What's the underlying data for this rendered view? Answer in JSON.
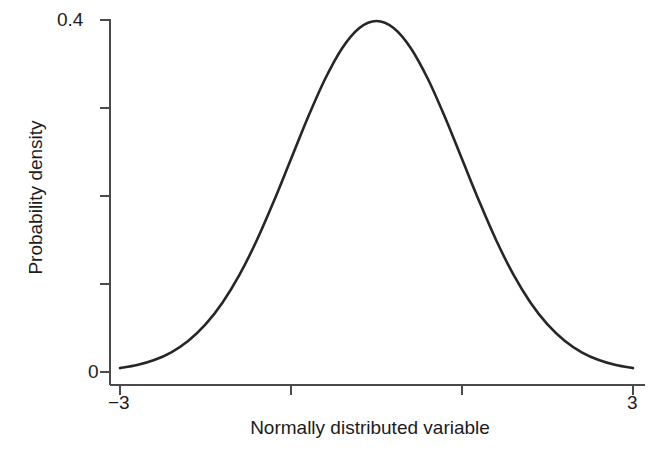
{
  "chart_data": {
    "type": "line",
    "title": "",
    "subtitle": "",
    "xlabel": "Normally distributed variable",
    "ylabel": "Probability density",
    "xlim": [
      -3,
      3
    ],
    "ylim": [
      0,
      0.4
    ],
    "grid": false,
    "legend": null,
    "legend_position": "none",
    "x_tick_labels": [
      "−3",
      "",
      "",
      "3"
    ],
    "x_tick_values": [
      -3,
      -1,
      1,
      3
    ],
    "y_tick_labels": [
      "0",
      "",
      "",
      "",
      "0.4"
    ],
    "y_tick_values": [
      0,
      0.1,
      0.2,
      0.3,
      0.4
    ],
    "series": [
      {
        "name": "standard normal density",
        "description": "Standard normal probability density function, mean 0, standard deviation 1",
        "x": [
          -3.0,
          -2.8,
          -2.6,
          -2.4,
          -2.2,
          -2.0,
          -1.8,
          -1.6,
          -1.4,
          -1.2,
          -1.0,
          -0.8,
          -0.6,
          -0.4,
          -0.2,
          0.0,
          0.2,
          0.4,
          0.6,
          0.8,
          1.0,
          1.2,
          1.4,
          1.6,
          1.8,
          2.0,
          2.2,
          2.4,
          2.6,
          2.8,
          3.0
        ],
        "y": [
          0.0044,
          0.0079,
          0.0136,
          0.0224,
          0.0355,
          0.054,
          0.079,
          0.1109,
          0.1497,
          0.1942,
          0.242,
          0.2897,
          0.3332,
          0.3683,
          0.391,
          0.3989,
          0.391,
          0.3683,
          0.3332,
          0.2897,
          0.242,
          0.1942,
          0.1497,
          0.1109,
          0.079,
          0.054,
          0.0355,
          0.0224,
          0.0136,
          0.0079,
          0.0044
        ]
      }
    ],
    "peak": {
      "x": 0.0,
      "y": 0.3989
    },
    "colors": {
      "curve": "#262626",
      "axis": "#4a4a4a",
      "text": "#1c1c1c",
      "background": "#ffffff"
    }
  },
  "axes": {
    "y_label_top": "0.4",
    "y_label_bottom": "0",
    "x_label_left": "−3",
    "x_label_right": "3",
    "x_title": "Normally distributed variable",
    "y_title": "Probability density"
  }
}
